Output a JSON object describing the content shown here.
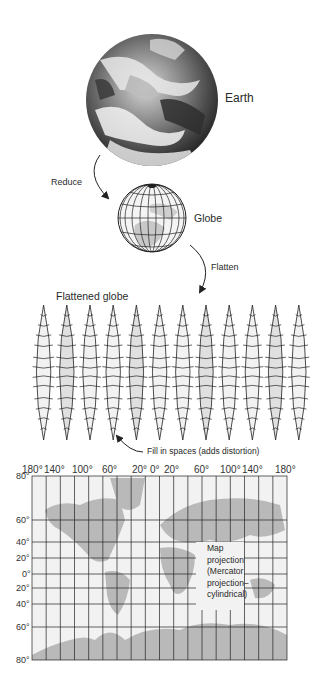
{
  "stages": {
    "earth": {
      "label": "Earth"
    },
    "reduce": {
      "label": "Reduce"
    },
    "globe": {
      "label": "Globe"
    },
    "flatten": {
      "label": "Flatten"
    },
    "flattened_globe": {
      "label": "Flattened globe",
      "gore_count": 12
    },
    "fill_in": {
      "label": "Fill in spaces (adds distortion)"
    },
    "map": {
      "caption_lines": [
        "Map",
        "projection",
        "(Mercator",
        "projection–",
        "cylindrical)"
      ],
      "longitude_ticks": [
        "180°",
        "140°",
        "100°",
        "60°",
        "20°",
        "0°",
        "20°",
        "60°",
        "100°",
        "140°",
        "180°"
      ],
      "latitude_ticks": [
        "80°",
        "60°",
        "40°",
        "20°",
        "0°",
        "20°",
        "40°",
        "60°",
        "80°"
      ]
    }
  },
  "colors": {
    "land": "#b9b9b9",
    "ocean": "#f2f2f2",
    "grid": "#222222",
    "earth_dark": "#3a3a3a"
  }
}
